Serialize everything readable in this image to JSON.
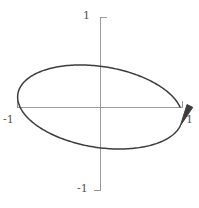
{
  "figure": {
    "width": 199,
    "height": 208,
    "background_color": "#ffffff"
  },
  "axes": {
    "axis_color": "#9a9a9a",
    "origin_px": {
      "x": 100,
      "y": 107
    },
    "x_axis": {
      "start_px": 17,
      "end_px": 183
    },
    "y_axis": {
      "start_px": 17,
      "end_px": 191
    }
  },
  "ticks": {
    "y_top": "1",
    "y_bottom": "-1",
    "x_left": "-1",
    "x_right": "1"
  },
  "curve": {
    "color": "#3d3d3d",
    "stroke_width": 1.5,
    "arrow_label": "arrowhead"
  },
  "chart_data": {
    "type": "line",
    "title": "",
    "xlabel": "",
    "ylabel": "",
    "xlim": [
      -1.2,
      1.2
    ],
    "ylim": [
      -1.2,
      1.2
    ],
    "grid": false,
    "legend": null,
    "xticks": [
      -1,
      1
    ],
    "xticklabels": [
      "-1",
      "1"
    ],
    "yticks": [
      -1,
      1
    ],
    "yticklabels": [
      "-1",
      "1"
    ],
    "annotations": [
      {
        "kind": "arrowhead",
        "x": 0.88,
        "y": 0.42,
        "direction": "clockwise",
        "note": "arrow on curve at upper-right indicating clockwise traversal"
      }
    ],
    "series": [
      {
        "name": "ellipse",
        "shape": "ellipse",
        "closed": true,
        "center": [
          0,
          0
        ],
        "semi_major": 1.0,
        "semi_minor": 0.45,
        "rotation_deg": -8,
        "orientation": "clockwise",
        "x": [
          1.0,
          0.97,
          0.89,
          0.76,
          0.59,
          0.39,
          0.17,
          -0.06,
          -0.28,
          -0.49,
          -0.67,
          -0.82,
          -0.93,
          -0.99,
          -1.0,
          -0.97,
          -0.89,
          -0.76,
          -0.59,
          -0.39,
          -0.17,
          0.06,
          0.28,
          0.49,
          0.67,
          0.82,
          0.93,
          0.99,
          1.0
        ],
        "y": [
          -0.14,
          0.0,
          0.13,
          0.25,
          0.34,
          0.41,
          0.44,
          0.45,
          0.42,
          0.36,
          0.27,
          0.16,
          0.04,
          -0.09,
          -0.14,
          -0.27,
          -0.4,
          -0.52,
          -0.61,
          -0.68,
          -0.71,
          -0.72,
          -0.69,
          -0.63,
          -0.54,
          -0.43,
          -0.31,
          -0.18,
          -0.14
        ]
      }
    ]
  }
}
